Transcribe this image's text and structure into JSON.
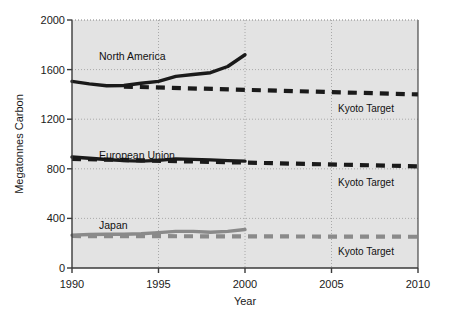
{
  "chart_data": {
    "type": "line",
    "title": "",
    "xlabel": "Year",
    "ylabel": "Megatonnes Carbon",
    "xlim": [
      1990,
      2010
    ],
    "ylim": [
      0,
      2000
    ],
    "xticks": [
      1990,
      1995,
      2000,
      2005,
      2010
    ],
    "yticks": [
      0,
      400,
      800,
      1200,
      1600,
      2000
    ],
    "grid": true,
    "legend_position": "inline-annotations",
    "x": [
      1990,
      1991,
      1992,
      1993,
      1994,
      1995,
      1996,
      1997,
      1998,
      1999,
      2000
    ],
    "series": [
      {
        "name": "North America",
        "style": "solid",
        "color": "#1a1a1a",
        "values": [
          1505,
          1485,
          1470,
          1472,
          1490,
          1505,
          1545,
          1560,
          1575,
          1625,
          1720
        ]
      },
      {
        "name": "European Union",
        "style": "solid",
        "color": "#1a1a1a",
        "values": [
          895,
          885,
          875,
          866,
          862,
          868,
          880,
          876,
          872,
          866,
          862
        ]
      },
      {
        "name": "Japan",
        "style": "solid",
        "color": "#8a8a8a",
        "values": [
          265,
          270,
          272,
          272,
          276,
          285,
          295,
          295,
          288,
          295,
          310
        ]
      }
    ],
    "targets": [
      {
        "name": "Kyoto Target",
        "applies_to": "North America",
        "style": "dashed",
        "color": "#1a1a1a",
        "x": [
          1993,
          2010
        ],
        "values": [
          1463,
          1400
        ]
      },
      {
        "name": "Kyoto Target",
        "applies_to": "European Union",
        "style": "dashed",
        "color": "#1a1a1a",
        "x": [
          1990,
          2010
        ],
        "values": [
          880,
          820
        ]
      },
      {
        "name": "Kyoto Target",
        "applies_to": "Japan",
        "style": "dashed",
        "color": "#8a8a8a",
        "x": [
          1990,
          2010
        ],
        "values": [
          258,
          252
        ]
      }
    ],
    "annotations": [
      {
        "text": "North America",
        "x": 1991.6,
        "y": 1790,
        "anchor": "start"
      },
      {
        "text": "European Union",
        "x": 1991.6,
        "y": 990,
        "anchor": "start"
      },
      {
        "text": "Japan",
        "x": 1991.6,
        "y": 420,
        "anchor": "start"
      },
      {
        "text": "Kyoto Target",
        "x": 2005.4,
        "y": 1320,
        "anchor": "start"
      },
      {
        "text": "Kyoto Target",
        "x": 2005.4,
        "y": 725,
        "anchor": "start"
      },
      {
        "text": "Kyoto Target",
        "x": 2005.4,
        "y": 170,
        "anchor": "start"
      }
    ]
  },
  "labels": {
    "ylabel": "Megatonnes Carbon",
    "xlabel": "Year",
    "ytick_0": "0",
    "ytick_400": "400",
    "ytick_800": "800",
    "ytick_1200": "1200",
    "ytick_1600": "1600",
    "ytick_2000": "2000",
    "xtick_1990": "1990",
    "xtick_1995": "1995",
    "xtick_2000": "2000",
    "xtick_2005": "2005",
    "xtick_2010": "2010",
    "series_north_america": "North America",
    "series_european_union": "European Union",
    "series_japan": "Japan",
    "kyoto_na": "Kyoto Target",
    "kyoto_eu": "Kyoto Target",
    "kyoto_jp": "Kyoto Target"
  },
  "colors": {
    "plot_background": "#e3e3e3",
    "axis": "#3a3a3a",
    "grid": "#9a9a9a",
    "series_dark": "#1a1a1a",
    "series_gray": "#8a8a8a",
    "text": "#1a1a1a"
  }
}
